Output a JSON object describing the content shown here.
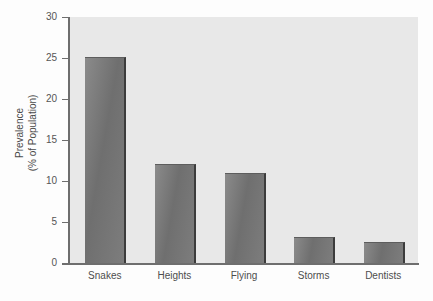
{
  "chart_data": {
    "type": "bar",
    "title": "",
    "xlabel": "",
    "ylabel": "Prevalence (% of Population)",
    "ylabel_line1": "Prevalence",
    "ylabel_line2": "(% of Population)",
    "categories": [
      "Snakes",
      "Heights",
      "Flying",
      "Storms",
      "Dentists"
    ],
    "values": [
      25,
      12,
      10.8,
      3,
      2.5
    ],
    "ylim": [
      0,
      30
    ],
    "yticks": [
      0,
      5,
      10,
      15,
      20,
      25,
      30
    ],
    "ytick_labels": [
      "0",
      "5",
      "10",
      "15",
      "20",
      "25",
      "30"
    ],
    "grid": false,
    "legend": null,
    "colors": {
      "plot_background": "#e8e8e8",
      "figure_background": "#fdfdfd",
      "bar_fill": "#777777",
      "bar_edge": "#3c3c3c",
      "axis": "#6e6e6e",
      "tick_text": "#555555",
      "label_text": "#4d4d4d"
    }
  }
}
